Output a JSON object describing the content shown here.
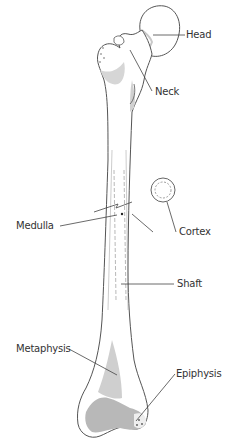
{
  "diagram": {
    "labels": {
      "head": "Head",
      "neck": "Neck",
      "medulla": "Medulla",
      "cortex": "Cortex",
      "shaft": "Shaft",
      "metaphysis": "Metaphysis",
      "epiphysis": "Epiphysis"
    },
    "colors": {
      "outline": "#555555",
      "shade": "#c8c8c8",
      "dark_shade": "#a8a8a8",
      "leader_line": "#444444",
      "text": "#333333"
    }
  }
}
